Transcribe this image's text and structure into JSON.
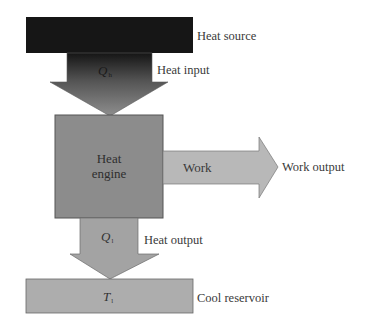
{
  "diagram": {
    "type": "heat-engine-flow",
    "heat_source": {
      "label": "Heat source",
      "color": "#161616"
    },
    "heat_input": {
      "label": "Heat input",
      "symbol": "Q",
      "subscript": "h"
    },
    "heat_engine": {
      "line1": "Heat",
      "line2": "engine",
      "color": "#8c8c8c"
    },
    "work": {
      "inner_label": "Work",
      "label": "Work output",
      "color": "#b8b8b8"
    },
    "heat_output": {
      "label": "Heat output",
      "symbol": "Q",
      "subscript": "l",
      "color": "#a3a3a3"
    },
    "cool_reservoir": {
      "label": "Cool reservoir",
      "symbol": "T",
      "subscript": "l",
      "color": "#adadad"
    }
  }
}
